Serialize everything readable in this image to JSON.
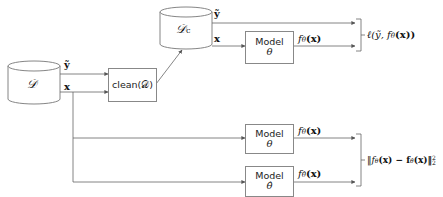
{
  "diagram": {
    "nodes": {
      "dataset": {
        "label": "𝒟",
        "shape": "cylinder"
      },
      "clean": {
        "label": "clean(𝒟)",
        "shape": "box"
      },
      "clean_dataset": {
        "label": "𝒟",
        "subscript": "c",
        "shape": "cylinder"
      },
      "model_top": {
        "title": "Model",
        "param": "θ",
        "shape": "box"
      },
      "model_mid": {
        "title": "Model",
        "param": "θ",
        "shape": "box"
      },
      "model_hat": {
        "title": "Model",
        "param": "θ̂",
        "shape": "box"
      }
    },
    "edge_labels": {
      "d_y": "ỹ",
      "d_x": "x",
      "dc_y": "ỹ",
      "dc_x": "x",
      "f_theta_top": "f",
      "f_theta_top_sub": "θ",
      "f_theta_top_arg": "(x)",
      "f_theta_mid": "f",
      "f_theta_mid_sub": "θ",
      "f_theta_mid_arg": "(x)",
      "f_hat": "f",
      "f_hat_sub": "θ̂",
      "f_hat_arg": "(x)"
    },
    "outputs": {
      "loss": "ℓ(ỹ, f",
      "loss_sub": "θ",
      "loss_tail": "(x))",
      "distill": "‖f",
      "distill_sub1": "θ",
      "distill_mid": "(x) − f",
      "distill_sub2": "θ̂",
      "distill_tail": "(x)‖",
      "distill_sup": "2",
      "distill_sub3": "2"
    },
    "colors": {
      "line": "#666666",
      "box_border": "#888888",
      "text": "#111111"
    }
  }
}
